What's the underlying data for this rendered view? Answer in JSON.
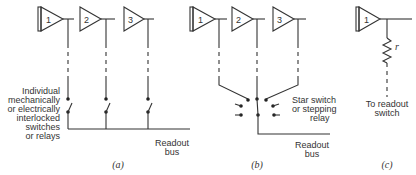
{
  "panels": {
    "a": {
      "caption": "(a)",
      "amplifiers": [
        "1",
        "2",
        "3"
      ],
      "switch_label": [
        "Individual",
        "mechanically",
        "or electrically",
        "interlocked",
        "switches",
        "or relays"
      ],
      "bus_label": [
        "Readout",
        "bus"
      ]
    },
    "b": {
      "caption": "(b)",
      "amplifiers": [
        "1",
        "2",
        "3"
      ],
      "switch_label": [
        "Star switch",
        "or stepping",
        "relay"
      ],
      "bus_label": [
        "Readout",
        "bus"
      ]
    },
    "c": {
      "caption": "(c)",
      "amplifiers": [
        "1"
      ],
      "resistor_label": "r",
      "output_label": [
        "To readout",
        "switch"
      ]
    }
  }
}
